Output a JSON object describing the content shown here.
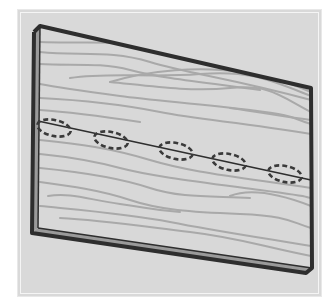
{
  "illustration": {
    "subject": "wooden board with dashed holes along a line",
    "colors": {
      "background": "#d9d9d9",
      "board_face": "#d8d8d8",
      "wood_grain": "#a9a9a9",
      "outline": "#2e2e2e",
      "edge_highlight": "#9a9a9a"
    },
    "board": {
      "face": [
        [
          40,
          26
        ],
        [
          311,
          88
        ],
        [
          312,
          268
        ],
        [
          38,
          228
        ]
      ],
      "edge_left": [
        [
          34,
          30
        ],
        [
          40,
          26
        ],
        [
          38,
          228
        ],
        [
          32,
          232
        ]
      ]
    },
    "guide_line": {
      "from": [
        38,
        121
      ],
      "to": [
        311,
        180
      ]
    },
    "holes": [
      {
        "cx": 54,
        "cy": 128
      },
      {
        "cx": 111,
        "cy": 140
      },
      {
        "cx": 176,
        "cy": 151
      },
      {
        "cx": 229,
        "cy": 162
      },
      {
        "cx": 285,
        "cy": 174
      }
    ],
    "hole_count": 5
  }
}
